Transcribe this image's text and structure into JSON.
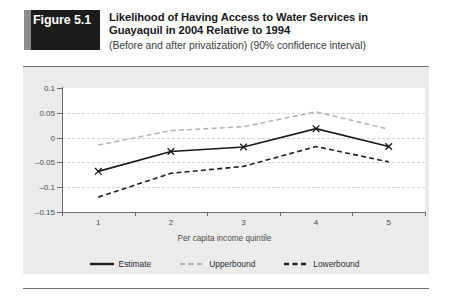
{
  "figure": {
    "badge_label": "Figure 5.1",
    "title_line_1": "Likelihood of Having Access to Water Services in",
    "title_line_2": "Guayaquil in 2004 Relative to 1994",
    "subtitle": "(Before and after privatization) (90% confidence interval)"
  },
  "colors": {
    "badge_background": "#1c1c1c",
    "badge_accent": "#8d8d8d",
    "panel_background": "#ebebeb",
    "plot_background": "#ffffff",
    "gridline": "#d4d4d4",
    "axis": "#6b6b6b",
    "estimate": "#1a1a1a",
    "upperbound": "#b5b5b5",
    "lowerbound": "#222222"
  },
  "chart_data": {
    "type": "line",
    "title": "Likelihood of Having Access to Water Services in Guayaquil in 2004 Relative to 1994",
    "subtitle": "(Before and after privatization) (90% confidence interval)",
    "xlabel": "Per capita income quintile",
    "ylabel": "",
    "x": [
      1,
      2,
      3,
      4,
      5
    ],
    "xticklabels": [
      "1",
      "2",
      "3",
      "4",
      "5"
    ],
    "yticklabels": [
      "0.1",
      "0.05",
      "0",
      "-0.05",
      "-0.1",
      "-0.15"
    ],
    "yticks": [
      0.1,
      0.05,
      0,
      -0.05,
      -0.1,
      -0.15
    ],
    "ylim": [
      -0.15,
      0.1
    ],
    "xlim": [
      0.5,
      5.5
    ],
    "grid": true,
    "legend_position": "bottom",
    "series": [
      {
        "name": "Estimate",
        "style": "solid",
        "marker": "x",
        "color": "#1a1a1a",
        "values": [
          -0.068,
          -0.028,
          -0.019,
          0.018,
          -0.018
        ]
      },
      {
        "name": "Upperbound",
        "style": "dashed",
        "marker": "none",
        "color": "#b5b5b5",
        "values": [
          -0.015,
          0.014,
          0.022,
          0.052,
          0.017
        ]
      },
      {
        "name": "Lowerbound",
        "style": "dashed",
        "marker": "none",
        "color": "#222222",
        "values": [
          -0.12,
          -0.072,
          -0.058,
          -0.018,
          -0.049
        ]
      }
    ]
  },
  "legend": {
    "items": [
      {
        "label": "Estimate"
      },
      {
        "label": "Upperbound"
      },
      {
        "label": "Lowerbound"
      }
    ]
  }
}
